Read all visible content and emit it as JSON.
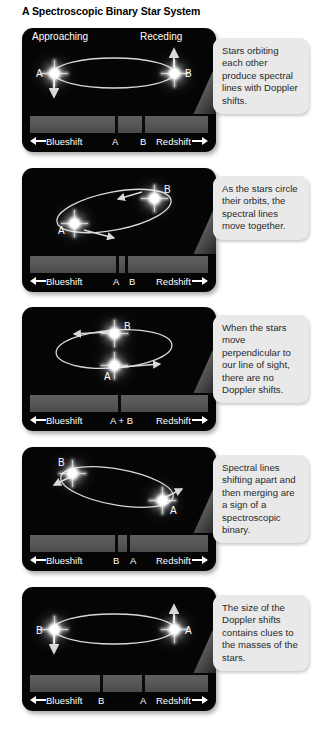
{
  "title": "A Spectroscopic Binary Star System",
  "axis": {
    "blueshift_label": "Blueshift",
    "redshift_label": "Redshift"
  },
  "panels": [
    {
      "id": "panel-1",
      "top_labels": [
        {
          "text": "Approaching",
          "x": 10,
          "y": 3
        },
        {
          "text": "Receding",
          "x": 118,
          "y": 3
        }
      ],
      "stars": [
        {
          "name": "A",
          "x": 32,
          "y": 45,
          "label_x": 14,
          "label_y": 40,
          "arrow": "down"
        },
        {
          "name": "B",
          "x": 152,
          "y": 45,
          "label_x": 163,
          "label_y": 40,
          "arrow": "up"
        }
      ],
      "orbit": {
        "cx": 92,
        "cy": 45,
        "rx": 60,
        "ry": 15,
        "rotate": 0
      },
      "motion_arrows": [],
      "spectrum_lines": [
        85,
        112
      ],
      "tick_labels": [
        {
          "text": "A",
          "x": 82
        },
        {
          "text": "B",
          "x": 110
        }
      ],
      "callout": "Stars orbiting each other produce spectral lines with Doppler shifts."
    },
    {
      "id": "panel-2",
      "top_labels": [],
      "stars": [
        {
          "name": "A",
          "x": 52,
          "y": 55,
          "label_x": 36,
          "label_y": 57,
          "arrow": "none"
        },
        {
          "name": "B",
          "x": 132,
          "y": 30,
          "label_x": 142,
          "label_y": 16,
          "arrow": "none"
        }
      ],
      "orbit": {
        "cx": 92,
        "cy": 43,
        "rx": 58,
        "ry": 19,
        "rotate": -11
      },
      "motion_arrows": [
        {
          "type": "curve",
          "d": "M 120 24 L 96 31",
          "head": "start-left"
        },
        {
          "type": "curve",
          "d": "M 62 62 L 92 70",
          "head": "end-right"
        }
      ],
      "spectrum_lines": [
        86,
        95
      ],
      "tick_labels": [
        {
          "text": "A",
          "x": 83
        },
        {
          "text": "B",
          "x": 99
        }
      ],
      "callout": "As the stars circle their orbits, the spectral lines move together."
    },
    {
      "id": "panel-3",
      "top_labels": [],
      "stars": [
        {
          "name": "B",
          "x": 92,
          "y": 26,
          "label_x": 102,
          "label_y": 14,
          "arrow": "none"
        },
        {
          "name": "A",
          "x": 92,
          "y": 58,
          "label_x": 82,
          "label_y": 64,
          "arrow": "none"
        }
      ],
      "orbit": {
        "cx": 92,
        "cy": 42,
        "rx": 58,
        "ry": 19,
        "rotate": -4
      },
      "motion_arrows": [
        {
          "type": "curve",
          "d": "M 86 25 L 52 27",
          "head": "start-left"
        },
        {
          "type": "curve",
          "d": "M 100 60 L 138 57",
          "head": "end-right"
        }
      ],
      "spectrum_lines": [
        88
      ],
      "tick_labels": [
        {
          "text": "A + B",
          "x": 80
        }
      ],
      "callout": "When the stars move perpendicular to our line of sight, there are no Doppler shifts."
    },
    {
      "id": "panel-4",
      "top_labels": [],
      "stars": [
        {
          "name": "B",
          "x": 50,
          "y": 26,
          "label_x": 36,
          "label_y": 10,
          "arrow": "none"
        },
        {
          "name": "A",
          "x": 140,
          "y": 53,
          "label_x": 148,
          "label_y": 58,
          "arrow": "none"
        }
      ],
      "orbit": {
        "cx": 95,
        "cy": 40,
        "rx": 57,
        "ry": 18,
        "rotate": 10
      },
      "motion_arrows": [
        {
          "type": "curve",
          "d": "M 52 28 L 32 38",
          "head": "end-left"
        },
        {
          "type": "curve",
          "d": "M 144 50 L 160 42",
          "head": "end-right"
        }
      ],
      "spectrum_lines": [
        85,
        97
      ],
      "tick_labels": [
        {
          "text": "B",
          "x": 83
        },
        {
          "text": "A",
          "x": 100
        }
      ],
      "callout": "Spectral lines shifting apart and then merging are a sign of a spectroscopic binary."
    },
    {
      "id": "panel-5",
      "top_labels": [],
      "stars": [
        {
          "name": "B",
          "x": 32,
          "y": 42,
          "label_x": 14,
          "label_y": 38,
          "arrow": "down"
        },
        {
          "name": "A",
          "x": 152,
          "y": 42,
          "label_x": 163,
          "label_y": 38,
          "arrow": "up"
        }
      ],
      "orbit": {
        "cx": 92,
        "cy": 42,
        "rx": 60,
        "ry": 15,
        "rotate": 0
      },
      "motion_arrows": [],
      "spectrum_lines": [
        70,
        112
      ],
      "tick_labels": [
        {
          "text": "B",
          "x": 68
        },
        {
          "text": "A",
          "x": 110
        }
      ],
      "callout": "The size of the Doppler shifts contains clues to the masses of the stars."
    }
  ],
  "colors": {
    "panel_bg": "#050505",
    "callout_bg": "#e9e9e9",
    "spectrum": "#585858",
    "absorption_line": "#0a0a0a",
    "star": "#ffffff",
    "orbit": "#d8d8d8"
  }
}
